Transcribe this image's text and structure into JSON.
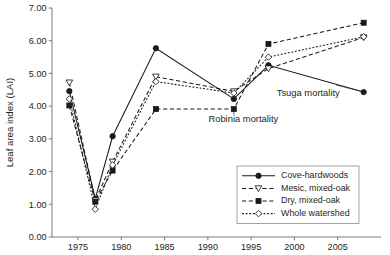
{
  "chart_data": {
    "type": "line",
    "title": "",
    "xlabel": "",
    "ylabel": "Leaf area index (LAI)",
    "xlim": [
      1972.0,
      2010.0
    ],
    "ylim": [
      0.0,
      7.0
    ],
    "grid": false,
    "legend_position": "inside-bottom-right",
    "x_ticks": [
      1975,
      1980,
      1985,
      1990,
      1995,
      2000,
      2005
    ],
    "x_tick_labels": [
      "1975",
      "1980",
      "1985",
      "1990",
      "1995",
      "2000",
      "2005"
    ],
    "y_ticks": [
      0,
      1,
      2,
      3,
      4,
      5,
      6,
      7
    ],
    "y_tick_labels": [
      "0.00",
      "1.00",
      "2.00",
      "3.00",
      "4.00",
      "5.00",
      "6.00",
      "7.00"
    ],
    "x": [
      1974,
      1977,
      1979,
      1984,
      1993,
      1997,
      2008
    ],
    "series": [
      {
        "name": "Cove-hardwoods",
        "marker": "filled-circle",
        "line": "solid",
        "values": [
          4.46,
          1.17,
          3.08,
          5.77,
          4.22,
          5.25,
          4.43
        ]
      },
      {
        "name": "Mesic, mixed-oak",
        "marker": "open-triangle-down",
        "line": "dashed",
        "values": [
          4.72,
          1.12,
          2.3,
          4.9,
          4.45,
          5.15,
          6.1
        ]
      },
      {
        "name": "Dry, mixed-oak",
        "marker": "filled-square",
        "line": "dashed",
        "values": [
          4.02,
          1.08,
          2.03,
          3.91,
          3.91,
          5.9,
          6.55
        ]
      },
      {
        "name": "Whole watershed",
        "marker": "open-diamond",
        "line": "dotted",
        "values": [
          4.22,
          0.85,
          2.2,
          4.75,
          4.4,
          5.5,
          6.12
        ]
      }
    ],
    "annotations": [
      {
        "text": "Robinia mortality",
        "x": 1994.1,
        "y": 3.52
      },
      {
        "text": "Tsuga mortality",
        "x": 2001.6,
        "y": 4.32
      }
    ]
  },
  "legend": {
    "items": [
      {
        "label": "Cove-hardwoods"
      },
      {
        "label": "Mesic, mixed-oak"
      },
      {
        "label": "Dry, mixed-oak"
      },
      {
        "label": "Whole watershed"
      }
    ]
  }
}
